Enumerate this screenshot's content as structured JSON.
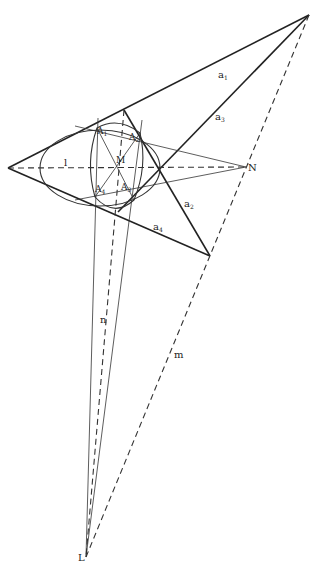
{
  "figure": {
    "width": 318,
    "height": 570,
    "labels": {
      "a1": "a",
      "a1_sub": "1",
      "a2": "a",
      "a2_sub": "2",
      "a3": "a",
      "a3_sub": "3",
      "a4": "a",
      "a4_sub": "4",
      "A1": "A",
      "A1_sub": "1",
      "A2": "A",
      "A2_sub": "2",
      "A3": "A",
      "A3_sub": "3",
      "A4": "A",
      "A4_sub": "4",
      "M": "M",
      "N": "N",
      "L": "L",
      "l": "l",
      "n": "n",
      "m": "m"
    },
    "points": {
      "P_left_vertex": [
        8,
        168
      ],
      "Q_top_right_vertex": [
        309,
        15
      ],
      "R_bottom_right_vertex": [
        210,
        256
      ],
      "N": [
        246,
        167
      ],
      "L": [
        86,
        557
      ],
      "M": [
        120,
        168
      ],
      "A1": [
        97,
        128
      ],
      "A2": [
        140,
        133
      ],
      "A3": [
        134,
        200
      ],
      "A4": [
        95,
        197
      ],
      "T_top": [
        124,
        110
      ],
      "T_bottom": [
        118,
        212
      ]
    },
    "colors": {
      "ink": "#222222",
      "background": "#ffffff"
    }
  }
}
